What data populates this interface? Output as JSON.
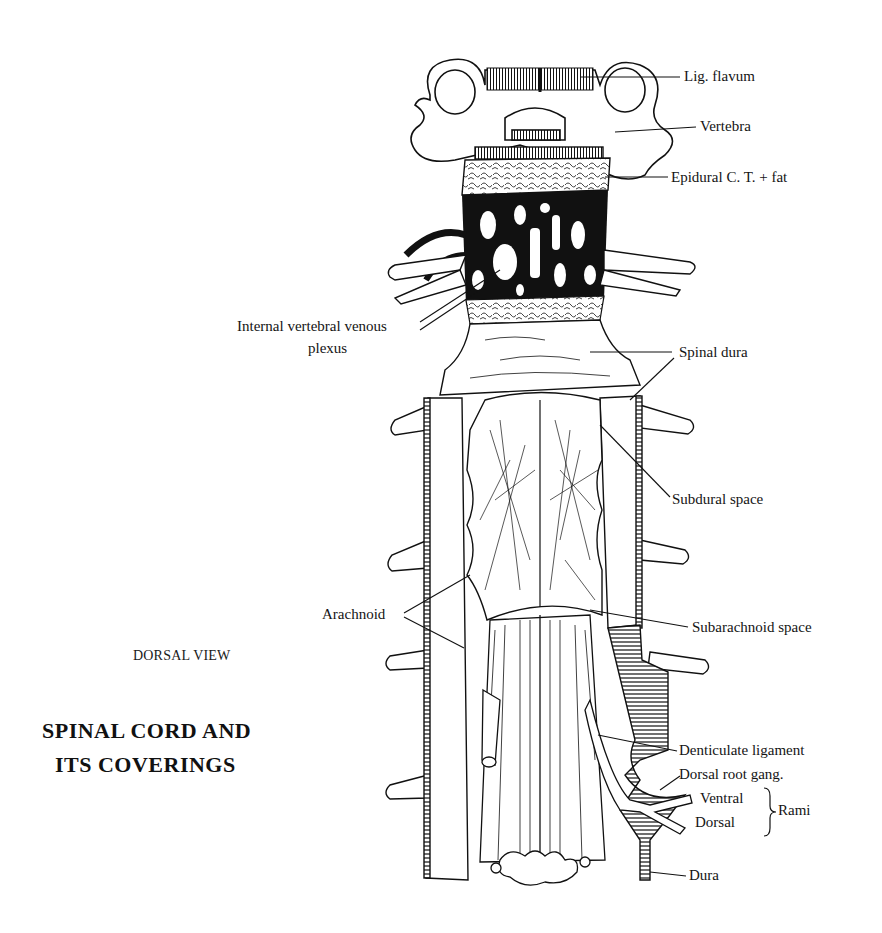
{
  "figure": {
    "view_caption": "DORSAL VIEW",
    "title_line1": "SPINAL CORD AND",
    "title_line2": "ITS COVERINGS"
  },
  "labels": {
    "lig_flavum": "Lig. flavum",
    "vertebra": "Vertebra",
    "epidural": "Epidural C. T. + fat",
    "venous_plexus_line1": "Internal vertebral venous",
    "venous_plexus_line2": "plexus",
    "spinal_dura": "Spinal dura",
    "subdural_space": "Subdural space",
    "arachnoid": "Arachnoid",
    "subarachnoid_space": "Subarachnoid space",
    "denticulate_ligament": "Denticulate ligament",
    "dorsal_root_gang": "Dorsal root gang.",
    "ventral": "Ventral",
    "dorsal": "Dorsal",
    "rami": "Rami",
    "dura": "Dura"
  },
  "colors": {
    "ink": "#111111",
    "paper": "#ffffff"
  }
}
